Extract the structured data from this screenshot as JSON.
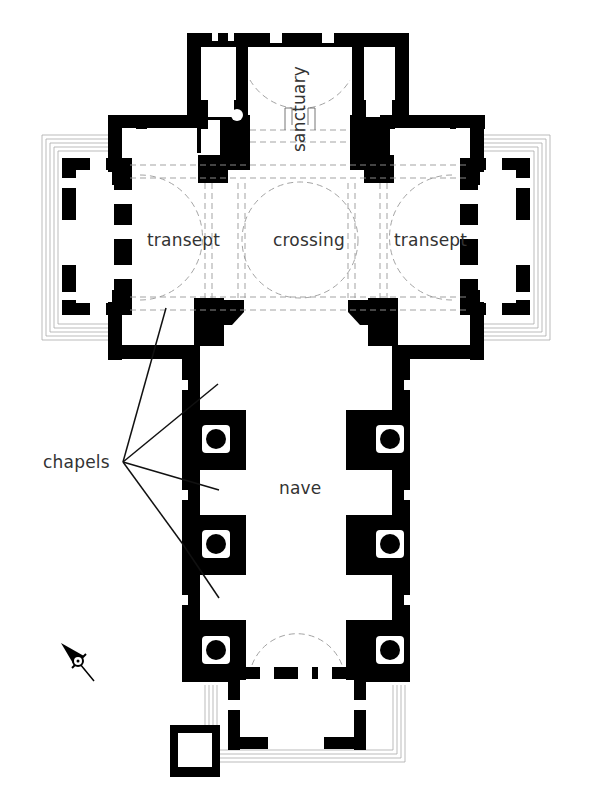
{
  "diagram": {
    "type": "architectural-floor-plan",
    "labels": {
      "sanctuary": "sanctuary",
      "crossing": "crossing",
      "transept_left": "transept",
      "transept_right": "transept",
      "nave": "nave",
      "chapels": "chapels"
    },
    "callouts": {
      "chapels_pointer_count": 5
    },
    "compass": {
      "icon": "north-arrow-icon",
      "direction": "north-west"
    },
    "colors": {
      "wall": "#000000",
      "background": "#ffffff",
      "dashed": "#999999",
      "label": "#333333"
    }
  }
}
